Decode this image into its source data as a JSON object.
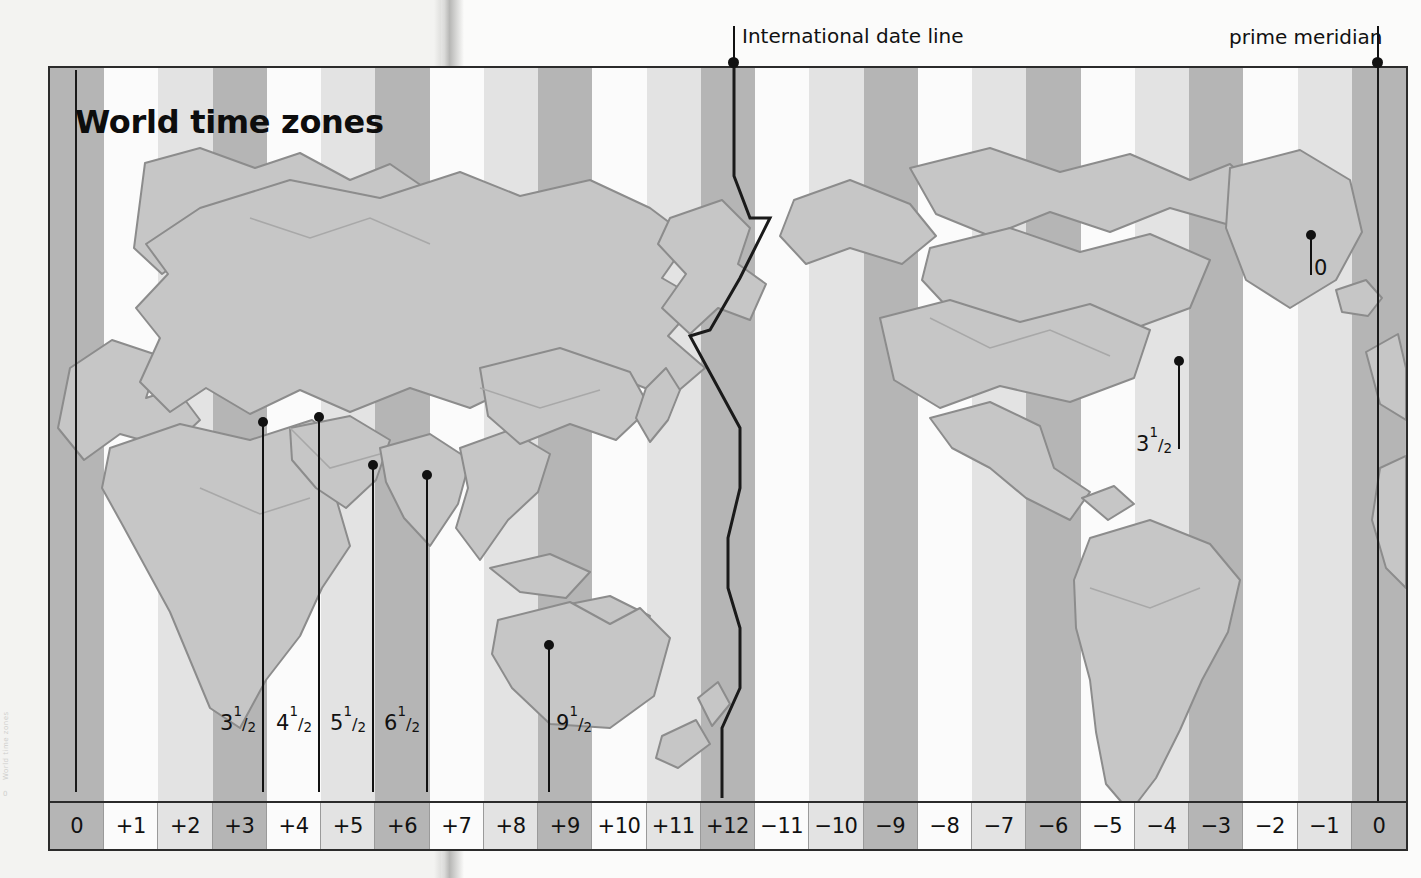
{
  "map": {
    "title": "World time zones",
    "zone_labels": [
      "0",
      "+1",
      "+2",
      "+3",
      "+4",
      "+5",
      "+6",
      "+7",
      "+8",
      "+9",
      "+10",
      "+11",
      "+12",
      "−11",
      "−10",
      "−9",
      "−8",
      "−7",
      "−6",
      "−5",
      "−4",
      "−3",
      "−2",
      "−1",
      "0"
    ],
    "callouts": [
      {
        "name": "international-date-line",
        "text": "International date line"
      },
      {
        "name": "prime-meridian",
        "text": "prime meridian"
      }
    ],
    "half_hour_markers": [
      {
        "name": "iran",
        "whole": "3",
        "num": "1",
        "den": "2"
      },
      {
        "name": "afghanistan",
        "whole": "4",
        "num": "1",
        "den": "2"
      },
      {
        "name": "india",
        "whole": "5",
        "num": "1",
        "den": "2"
      },
      {
        "name": "myanmar",
        "whole": "6",
        "num": "1",
        "den": "2"
      },
      {
        "name": "australia-central",
        "whole": "9",
        "num": "1",
        "den": "2"
      },
      {
        "name": "newfoundland",
        "whole": "3",
        "num": "1",
        "den": "2"
      }
    ],
    "iceland_marker": {
      "name": "iceland",
      "label": "0"
    },
    "gutter": {
      "text": "World time zones",
      "page_number": "0"
    },
    "colors": {
      "band_dark": "#b5b5b5",
      "band_light": "#e3e3e3",
      "band_white": "#fbfbfb",
      "land_fill": "#c9c9c9",
      "land_outline": "#8a8a8a",
      "border": "#2b2b2b",
      "line": "#1a1a1a",
      "text": "#111111"
    }
  }
}
